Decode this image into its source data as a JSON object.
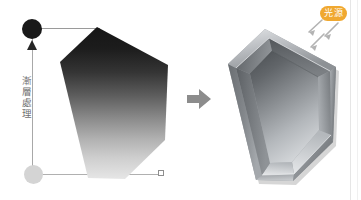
{
  "canvas": {
    "width": 361,
    "height": 200,
    "background": "#ffffff"
  },
  "gradient_control": {
    "label_text": "漸層處理",
    "start_handle": {
      "name": "gradient-start-handle",
      "color": "#191919",
      "position_label": "top"
    },
    "end_handle": {
      "name": "gradient-end-handle",
      "color": "#d4d4d4",
      "position_label": "bottom"
    },
    "axis_color": "#a8a8a8",
    "connector_color": "#9a9a9a",
    "endpoint_marker_color": "#8e8e8e"
  },
  "flat_shape": {
    "name": "gradient-hexagon",
    "gradient_from": "#1a1a1a",
    "gradient_to": "#e4e4e4",
    "description": "hexagon with vertical dark-to-light gradient"
  },
  "transform_arrow": {
    "name": "transform-arrow",
    "color": "#8c8c8c",
    "direction": "right"
  },
  "bevel_shape": {
    "name": "beveled-hexagon",
    "description": "extruded hexagonal tray with recessed inner face",
    "top_bevel_color": "#b9bcc0",
    "inner_face_color": "#9da1a6",
    "outer_wall_color": "#6e7276",
    "highlight_color": "#e8eaec",
    "shadow_color": "#4a4e52"
  },
  "light_source": {
    "badge_text": "光源",
    "badge_color": "#f0a830",
    "badge_text_color": "#ffffff",
    "ray_color": "#b3b3b3",
    "ray_count": 3,
    "ray_direction": "down-left"
  }
}
